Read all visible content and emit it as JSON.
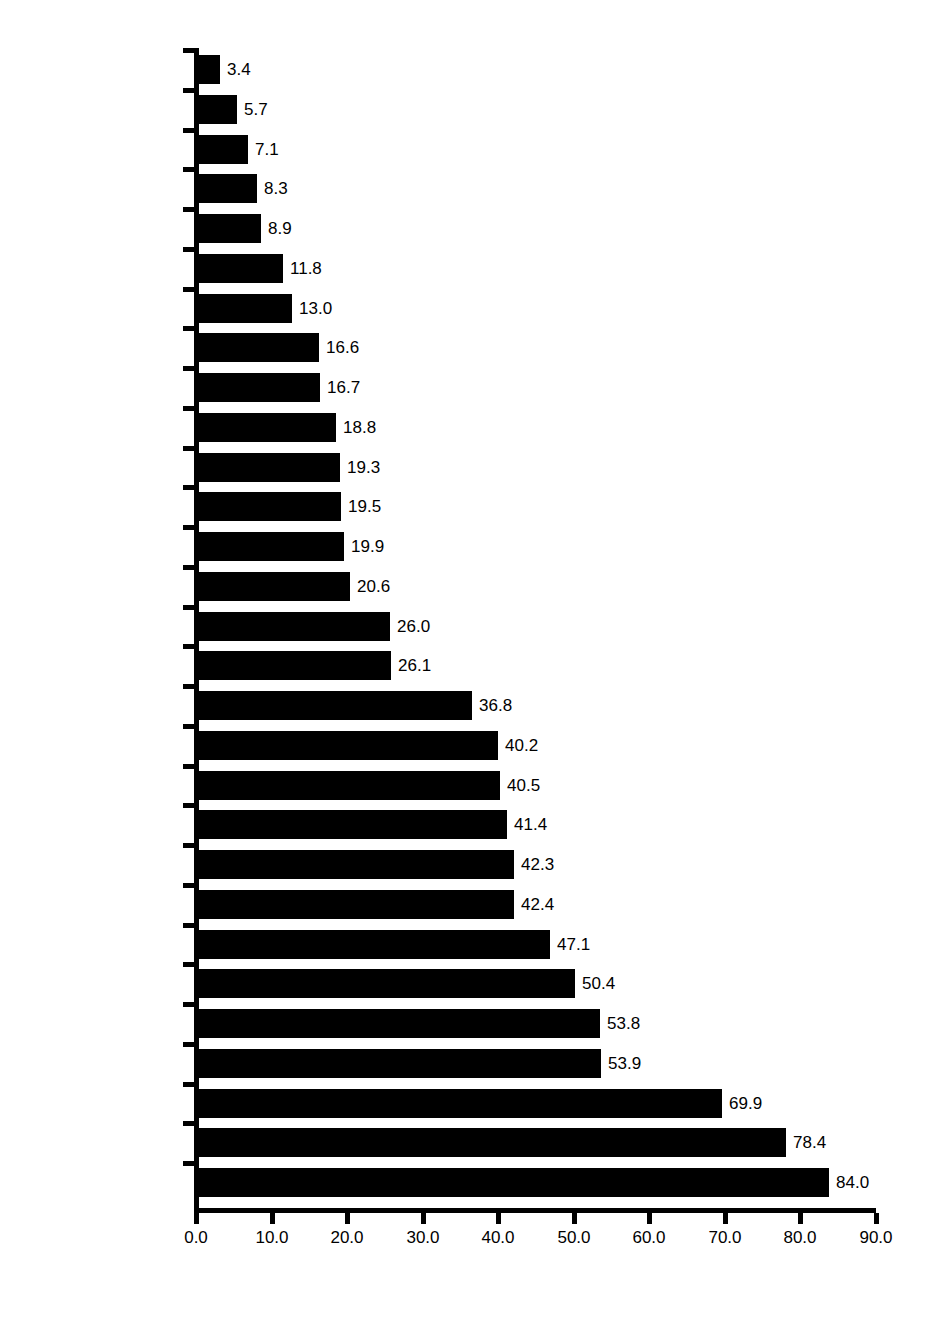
{
  "chart_data": {
    "type": "bar",
    "orientation": "horizontal",
    "title": "",
    "subtitle": "",
    "xlabel": "",
    "ylabel": "",
    "xlim": [
      0.0,
      90.0
    ],
    "xticks": [
      "0.0",
      "10.0",
      "20.0",
      "30.0",
      "40.0",
      "50.0",
      "60.0",
      "70.0",
      "80.0",
      "90.0"
    ],
    "xtick_values": [
      0,
      10,
      20,
      30,
      40,
      50,
      60,
      70,
      80,
      90
    ],
    "grid": false,
    "legend": null,
    "bar_color": "#000000",
    "background_color": "#ffffff",
    "value_label_format": "one-decimal",
    "categories": [
      "Paraguay",
      "St. Vincent",
      "Uruguay",
      "Argentina",
      "Dominica",
      "Grenada",
      "Panama",
      "Chile",
      "Barbados",
      "Suriname",
      "El Salvador",
      "Brazil",
      "Peru",
      "Guyana",
      "Bahamas",
      "Bolivia",
      "Ecuador",
      "Trinidad",
      "Colombia",
      "Guatemala",
      "Belize",
      "Jamaica",
      "Dominican Republic",
      "Costa Rica",
      "Nicaragua",
      "Venezuela",
      "Honduras",
      "Haiti",
      "Mexico"
    ],
    "values": [
      3.4,
      5.7,
      7.1,
      8.3,
      8.9,
      11.8,
      13.0,
      16.6,
      16.7,
      18.8,
      19.3,
      19.5,
      19.9,
      20.6,
      26.0,
      26.1,
      36.8,
      40.2,
      40.5,
      41.4,
      42.3,
      42.4,
      47.1,
      50.4,
      53.8,
      53.9,
      69.9,
      78.4,
      84.0
    ],
    "value_labels": [
      "3.4",
      "5.7",
      "7.1",
      "8.3",
      "8.9",
      "11.8",
      "13.0",
      "16.6",
      "16.7",
      "18.8",
      "19.3",
      "19.5",
      "19.9",
      "20.6",
      "26.0",
      "26.1",
      "36.8",
      "40.2",
      "40.5",
      "41.4",
      "42.3",
      "42.4",
      "47.1",
      "50.4",
      "53.8",
      "53.9",
      "69.9",
      "78.4",
      "84.0"
    ]
  }
}
